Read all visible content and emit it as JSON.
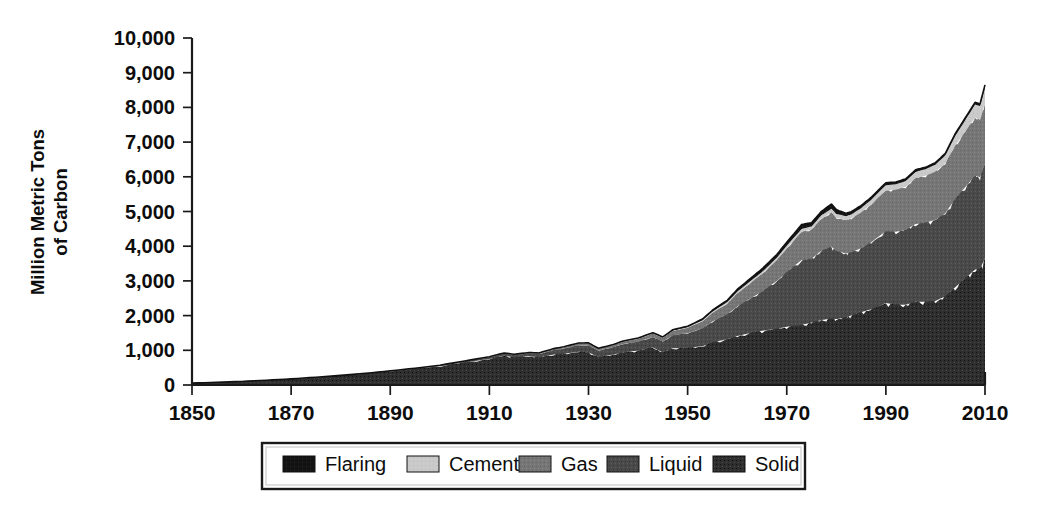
{
  "chart_data": {
    "type": "area",
    "stacked": true,
    "title": "",
    "subtitle": "",
    "xlabel": "",
    "ylabel": "Million Metric Tons of Carbon",
    "ylabel_lines": [
      "Million Metric Tons",
      "of Carbon"
    ],
    "xlim": [
      1850,
      2010
    ],
    "ylim": [
      0,
      10000
    ],
    "grid": false,
    "legend_position": "bottom",
    "xticks": [
      1850,
      1870,
      1890,
      1910,
      1930,
      1950,
      1970,
      1990,
      2010
    ],
    "xtick_labels": [
      "1850",
      "1870",
      "1890",
      "1910",
      "1930",
      "1950",
      "1970",
      "1990",
      "2010"
    ],
    "yticks": [
      0,
      1000,
      2000,
      3000,
      4000,
      5000,
      6000,
      7000,
      8000,
      9000,
      10000
    ],
    "ytick_labels": [
      "0",
      "1,000",
      "2,000",
      "3,000",
      "4,000",
      "5,000",
      "6,000",
      "7,000",
      "8,000",
      "9,000",
      "10,000"
    ],
    "x": [
      1850,
      1855,
      1860,
      1865,
      1870,
      1875,
      1880,
      1885,
      1890,
      1895,
      1900,
      1905,
      1910,
      1913,
      1915,
      1918,
      1920,
      1923,
      1925,
      1928,
      1930,
      1932,
      1935,
      1937,
      1940,
      1943,
      1945,
      1947,
      1950,
      1953,
      1955,
      1958,
      1960,
      1963,
      1965,
      1968,
      1970,
      1973,
      1975,
      1977,
      1979,
      1980,
      1982,
      1983,
      1985,
      1987,
      1990,
      1992,
      1994,
      1996,
      1998,
      2000,
      2002,
      2004,
      2006,
      2008,
      2009,
      2010
    ],
    "series": [
      {
        "name": "Solid",
        "color": "#2e2e2e",
        "values": [
          54,
          78,
          103,
          137,
          176,
          222,
          273,
          328,
          394,
          466,
          543,
          650,
          750,
          843,
          795,
          830,
          795,
          880,
          900,
          960,
          940,
          800,
          880,
          940,
          990,
          1080,
          940,
          1060,
          1070,
          1120,
          1230,
          1320,
          1410,
          1510,
          1560,
          1620,
          1680,
          1730,
          1800,
          1870,
          1920,
          1900,
          1950,
          2000,
          2100,
          2180,
          2360,
          2320,
          2310,
          2400,
          2400,
          2420,
          2560,
          2820,
          3070,
          3330,
          3350,
          3650
        ]
      },
      {
        "name": "Liquid",
        "color": "#494949",
        "values": [
          0,
          0,
          0,
          1,
          1,
          2,
          4,
          6,
          10,
          14,
          20,
          32,
          48,
          60,
          66,
          80,
          96,
          126,
          150,
          184,
          200,
          190,
          210,
          240,
          260,
          300,
          310,
          370,
          420,
          510,
          600,
          720,
          850,
          1010,
          1130,
          1380,
          1580,
          1870,
          1840,
          2000,
          2070,
          1960,
          1840,
          1830,
          1840,
          1930,
          2070,
          2100,
          2160,
          2240,
          2280,
          2340,
          2390,
          2550,
          2630,
          2700,
          2640,
          2730
        ]
      },
      {
        "name": "Gas",
        "color": "#747474",
        "values": [
          0,
          0,
          0,
          0,
          0,
          0,
          0,
          1,
          2,
          3,
          5,
          8,
          12,
          15,
          17,
          21,
          25,
          33,
          40,
          50,
          56,
          52,
          58,
          68,
          80,
          100,
          110,
          130,
          160,
          210,
          250,
          310,
          380,
          460,
          510,
          600,
          680,
          810,
          840,
          920,
          980,
          960,
          960,
          970,
          1030,
          1090,
          1180,
          1210,
          1240,
          1320,
          1350,
          1390,
          1440,
          1530,
          1600,
          1680,
          1650,
          1750
        ]
      },
      {
        "name": "Cement",
        "color": "#c8c8c8",
        "values": [
          0,
          0,
          0,
          0,
          0,
          0,
          0,
          0,
          1,
          1,
          2,
          3,
          4,
          5,
          5,
          5,
          6,
          8,
          10,
          12,
          13,
          10,
          12,
          14,
          16,
          17,
          14,
          18,
          21,
          28,
          33,
          40,
          45,
          52,
          57,
          65,
          73,
          88,
          90,
          99,
          110,
          110,
          112,
          115,
          125,
          135,
          150,
          156,
          166,
          180,
          190,
          200,
          230,
          280,
          330,
          370,
          400,
          450
        ]
      },
      {
        "name": "Flaring",
        "color": "#131313",
        "values": [
          0,
          0,
          0,
          0,
          0,
          0,
          0,
          0,
          0,
          0,
          0,
          0,
          1,
          1,
          1,
          1,
          2,
          2,
          3,
          4,
          5,
          5,
          6,
          7,
          8,
          10,
          11,
          14,
          23,
          32,
          40,
          53,
          65,
          77,
          85,
          95,
          105,
          125,
          110,
          110,
          140,
          125,
          85,
          80,
          75,
          70,
          67,
          64,
          64,
          62,
          58,
          57,
          58,
          62,
          65,
          68,
          64,
          68
        ]
      }
    ]
  },
  "legend": {
    "entries": [
      {
        "label": "Flaring",
        "color": "#131313"
      },
      {
        "label": "Cement",
        "color": "#c8c8c8"
      },
      {
        "label": "Gas",
        "color": "#747474"
      },
      {
        "label": "Liquid",
        "color": "#494949"
      },
      {
        "label": "Solid",
        "color": "#2e2e2e"
      }
    ]
  }
}
